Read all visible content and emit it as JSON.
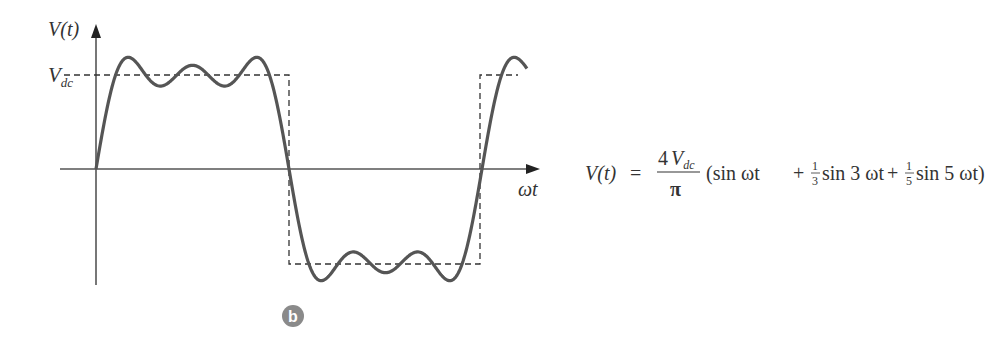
{
  "figure": {
    "badge_label": "b",
    "y_axis_label": "V(t)",
    "x_axis_label": "ωt",
    "level_label_main": "V",
    "level_label_sub": "dc",
    "colors": {
      "curve": "#555555",
      "axis": "#555555",
      "dashed": "#333333",
      "badge": "#8a8a8a",
      "text": "#333333"
    }
  },
  "equation": {
    "lhs": "V(t)",
    "equals": "=",
    "coef_numerator_num": "4",
    "coef_numerator_var": "V",
    "coef_numerator_sub": "dc",
    "coef_denominator": "π",
    "term1": "(sin ωt",
    "plus1": "+",
    "frac2_num": "1",
    "frac2_den": "3",
    "term2": "sin 3 ωt",
    "plus2": "+",
    "frac3_num": "1",
    "frac3_den": "5",
    "term3": "sin 5 ωt)"
  },
  "chart_data": {
    "type": "line",
    "title": "",
    "xlabel": "ωt",
    "ylabel": "V(t)",
    "series": [
      {
        "name": "Fourier approximation (3 terms)",
        "style": "solid",
        "formula": "(4Vdc/π)(sin ωt + 1/3 sin 3ωt + 1/5 sin 5ωt)"
      },
      {
        "name": "Square wave",
        "style": "dashed",
        "levels": [
          "+Vdc",
          "-Vdc"
        ]
      }
    ],
    "annotations": [
      "V_dc level marker"
    ],
    "grid": false
  }
}
